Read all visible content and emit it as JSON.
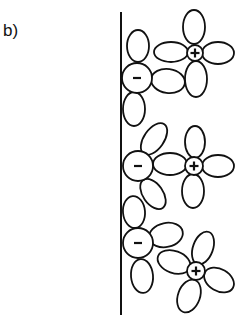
{
  "figure": {
    "panel_label": "b)",
    "wall": {
      "x": 121,
      "y1": 12,
      "y2": 315
    },
    "colors": {
      "line": "#111111",
      "background": "#ffffff"
    },
    "ions": [
      {
        "id": "anion-1",
        "charge": "-",
        "label": "−",
        "cx": 137,
        "cy": 78,
        "r": 15,
        "petals": [
          {
            "cx": 138,
            "cy": 46,
            "rx": 11,
            "ry": 16,
            "rot": 0
          },
          {
            "cx": 168,
            "cy": 81,
            "rx": 17,
            "ry": 12,
            "rot": 8
          },
          {
            "cx": 134,
            "cy": 109,
            "rx": 11,
            "ry": 17,
            "rot": 0
          }
        ]
      },
      {
        "id": "cation-1",
        "charge": "+",
        "label": "+",
        "cx": 195,
        "cy": 53,
        "r": 8,
        "petals": [
          {
            "cx": 194,
            "cy": 27,
            "rx": 11,
            "ry": 17,
            "rot": 0
          },
          {
            "cx": 171,
            "cy": 52,
            "rx": 17,
            "ry": 10,
            "rot": 0
          },
          {
            "cx": 218,
            "cy": 53,
            "rx": 16,
            "ry": 11,
            "rot": 0
          },
          {
            "cx": 196,
            "cy": 79,
            "rx": 11,
            "ry": 18,
            "rot": 0
          }
        ]
      },
      {
        "id": "anion-2",
        "charge": "-",
        "label": "−",
        "cx": 138,
        "cy": 166,
        "r": 15,
        "petals": [
          {
            "cx": 154,
            "cy": 139,
            "rx": 10,
            "ry": 18,
            "rot": 35
          },
          {
            "cx": 170,
            "cy": 164,
            "rx": 17,
            "ry": 11,
            "rot": 0
          },
          {
            "cx": 153,
            "cy": 194,
            "rx": 10,
            "ry": 17,
            "rot": -35
          }
        ]
      },
      {
        "id": "cation-2",
        "charge": "+",
        "label": "+",
        "cx": 194,
        "cy": 166,
        "r": 9,
        "petals": [
          {
            "cx": 195,
            "cy": 142,
            "rx": 10,
            "ry": 16,
            "rot": 0
          },
          {
            "cx": 218,
            "cy": 166,
            "rx": 16,
            "ry": 11,
            "rot": 0
          },
          {
            "cx": 193,
            "cy": 191,
            "rx": 11,
            "ry": 17,
            "rot": 0
          }
        ]
      },
      {
        "id": "anion-3",
        "charge": "-",
        "label": "−",
        "cx": 138,
        "cy": 243,
        "r": 15,
        "petals": [
          {
            "cx": 134,
            "cy": 212,
            "rx": 11,
            "ry": 16,
            "rot": -5
          },
          {
            "cx": 166,
            "cy": 235,
            "rx": 17,
            "ry": 12,
            "rot": -12
          },
          {
            "cx": 142,
            "cy": 276,
            "rx": 11,
            "ry": 17,
            "rot": -5
          }
        ]
      },
      {
        "id": "cation-3",
        "charge": "+",
        "label": "+",
        "cx": 196,
        "cy": 271,
        "r": 9,
        "petals": [
          {
            "cx": 203,
            "cy": 248,
            "rx": 10,
            "ry": 17,
            "rot": 20
          },
          {
            "cx": 174,
            "cy": 262,
            "rx": 17,
            "ry": 11,
            "rot": 20
          },
          {
            "cx": 219,
            "cy": 280,
            "rx": 16,
            "ry": 11,
            "rot": 30
          },
          {
            "cx": 189,
            "cy": 296,
            "rx": 11,
            "ry": 17,
            "rot": 20
          }
        ]
      }
    ]
  }
}
